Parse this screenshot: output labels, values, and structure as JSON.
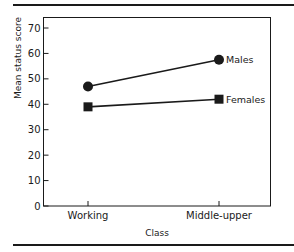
{
  "chart_data": {
    "type": "line",
    "title": "",
    "xlabel": "Class",
    "ylabel": "Mean status score",
    "categories": [
      "Working",
      "Middle-upper"
    ],
    "series": [
      {
        "name": "Males",
        "marker": "circle",
        "values": [
          47,
          57.5
        ]
      },
      {
        "name": "Females",
        "marker": "square",
        "values": [
          39,
          42
        ]
      }
    ],
    "ylim": [
      0,
      70
    ],
    "yticks": [
      0,
      10,
      20,
      30,
      40,
      50,
      60,
      70
    ],
    "grid": false,
    "legend_position": "inline-right"
  },
  "colors": {
    "ink": "#1a1a1a",
    "background": "#ffffff"
  }
}
